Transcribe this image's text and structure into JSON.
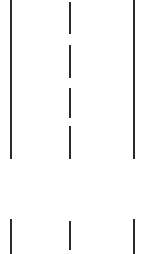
{
  "figure": {
    "background_color": "#ffffff",
    "line_color": "#2b2b2b",
    "width": 153,
    "height": 254
  },
  "chart_data": {
    "type": "diagram",
    "xlabel": "",
    "ylabel": "",
    "xlim": [
      0,
      153
    ],
    "ylim": [
      0,
      254
    ],
    "grid": false,
    "legend": null,
    "background": "#ffffff",
    "stroke_color": "#2b2b2b",
    "stroke_width": 2,
    "bands": [
      {
        "name": "upper-roadway-band",
        "y_start": 0,
        "y_end": 160
      },
      {
        "name": "gap-band",
        "y_start": 160,
        "y_end": 219
      },
      {
        "name": "lower-roadway-band",
        "y_start": 219,
        "y_end": 254
      }
    ],
    "markings": [
      {
        "id": "upper-left-edge-line",
        "label": "Left solid edge line (upper)",
        "style": "solid",
        "band": "upper-roadway-band",
        "x": 11,
        "y_start": 0,
        "y_end": 159,
        "length": 159,
        "width": 2
      },
      {
        "id": "upper-centre-dash-1",
        "label": "Centre lane dash 1",
        "style": "dashed",
        "band": "upper-roadway-band",
        "x": 70,
        "y_start": 2,
        "y_end": 34,
        "length": 32,
        "width": 2
      },
      {
        "id": "upper-centre-dash-2",
        "label": "Centre lane dash 2",
        "style": "dashed",
        "band": "upper-roadway-band",
        "x": 70,
        "y_start": 45,
        "y_end": 78,
        "length": 33,
        "width": 2
      },
      {
        "id": "upper-centre-dash-3",
        "label": "Centre lane dash 3",
        "style": "dashed",
        "band": "upper-roadway-band",
        "x": 70,
        "y_start": 88,
        "y_end": 118,
        "length": 30,
        "width": 2
      },
      {
        "id": "upper-centre-dash-4",
        "label": "Centre lane dash 4",
        "style": "dashed",
        "band": "upper-roadway-band",
        "x": 70,
        "y_start": 126,
        "y_end": 159,
        "length": 33,
        "width": 2
      },
      {
        "id": "upper-right-edge-line",
        "label": "Right solid edge line (upper)",
        "style": "solid",
        "band": "upper-roadway-band",
        "x": 134,
        "y_start": 0,
        "y_end": 159,
        "length": 159,
        "width": 2
      },
      {
        "id": "lower-left-edge-line",
        "label": "Left solid edge line (lower)",
        "style": "solid",
        "band": "lower-roadway-band",
        "x": 11,
        "y_start": 219,
        "y_end": 254,
        "length": 35,
        "width": 2
      },
      {
        "id": "lower-centre-dash",
        "label": "Centre lane dash (lower)",
        "style": "dashed",
        "band": "lower-roadway-band",
        "x": 70,
        "y_start": 221,
        "y_end": 250,
        "length": 29,
        "width": 2
      },
      {
        "id": "lower-right-edge-line",
        "label": "Right solid edge line (lower)",
        "style": "solid",
        "band": "lower-roadway-band",
        "x": 134,
        "y_start": 219,
        "y_end": 254,
        "length": 35,
        "width": 2
      }
    ],
    "dash_gaps": [
      {
        "after": "upper-centre-dash-1",
        "y_start": 34,
        "y_end": 45,
        "length": 11
      },
      {
        "after": "upper-centre-dash-2",
        "y_start": 78,
        "y_end": 88,
        "length": 10
      },
      {
        "after": "upper-centre-dash-3",
        "y_start": 118,
        "y_end": 126,
        "length": 8
      }
    ],
    "lane_positions_x": [
      11,
      70,
      134
    ],
    "lane_widths": [
      59,
      64
    ]
  }
}
